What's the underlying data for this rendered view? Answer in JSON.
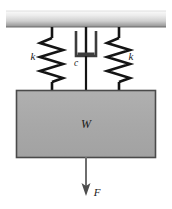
{
  "figure": {
    "type": "mechanical-system-diagram",
    "title": "",
    "colors": {
      "ceiling_light": "#f2f2f2",
      "ceiling_dark": "#9a9a9a",
      "block_fill": "#a9a9a9",
      "block_border": "#4a4a4a",
      "spring_stroke": "#141414",
      "rod_stroke": "#141414",
      "damper_stroke": "#3c3c3c",
      "arrow_shaft": "#6e6e6e",
      "arrow_head": "#4d4d4d",
      "label_color": "#1a1a1a",
      "background": "#ffffff"
    },
    "ceiling": {
      "name": "fixed-support",
      "hatching": false
    },
    "elements": [
      {
        "id": "spring-left",
        "kind": "spring",
        "label": "k",
        "label_x": 33,
        "label_y": 60,
        "center_x": 52,
        "coils": 7
      },
      {
        "id": "damper-center",
        "kind": "damper",
        "label": "c",
        "label_x": 76,
        "label_y": 66,
        "center_x": 86
      },
      {
        "id": "spring-right",
        "kind": "spring",
        "label": "k",
        "label_x": 131,
        "label_y": 60,
        "center_x": 119,
        "coils": 7
      }
    ],
    "mass_block": {
      "label": "W",
      "label_x": 86,
      "label_y": 128
    },
    "force_arrow": {
      "label": "F",
      "label_x": 94,
      "label_y": 196,
      "direction": "down",
      "center_x": 86
    }
  }
}
